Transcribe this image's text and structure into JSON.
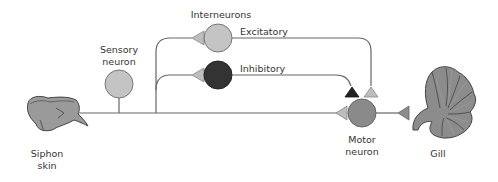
{
  "diagram": {
    "type": "neural circuit (gill-withdrawal reflex)",
    "labels": {
      "siphon_line1": "Siphon",
      "siphon_line2": "skin",
      "sensory_line1": "Sensory",
      "sensory_line2": "neuron",
      "interneurons": "Interneurons",
      "excitatory": "Excitatory",
      "inhibitory": "Inhibitory",
      "motor_line1": "Motor",
      "motor_line2": "neuron",
      "gill": "Gill"
    },
    "nodes": [
      {
        "id": "siphon-skin",
        "kind": "organ"
      },
      {
        "id": "sensory-neuron",
        "kind": "neuron",
        "fill": "#c4c4c4"
      },
      {
        "id": "excitatory-interneuron",
        "kind": "neuron",
        "fill": "#c4c4c4"
      },
      {
        "id": "inhibitory-interneuron",
        "kind": "neuron",
        "fill": "#333333"
      },
      {
        "id": "motor-neuron",
        "kind": "neuron",
        "fill": "#8a8a8a"
      },
      {
        "id": "gill",
        "kind": "organ"
      }
    ],
    "connections": [
      {
        "from": "siphon-skin",
        "to": "sensory-neuron"
      },
      {
        "from": "sensory-neuron",
        "to": "excitatory-interneuron",
        "synapse": "light"
      },
      {
        "from": "sensory-neuron",
        "to": "inhibitory-interneuron",
        "synapse": "light"
      },
      {
        "from": "sensory-neuron",
        "to": "motor-neuron",
        "synapse": "light"
      },
      {
        "from": "excitatory-interneuron",
        "to": "motor-neuron",
        "synapse": "light"
      },
      {
        "from": "inhibitory-interneuron",
        "to": "motor-neuron",
        "synapse": "dark"
      },
      {
        "from": "motor-neuron",
        "to": "gill",
        "synapse": "medium"
      }
    ],
    "colors": {
      "line": "#666666",
      "light_synapse": "#bdbdbd",
      "dark_synapse": "#222222",
      "medium_synapse": "#8c8c8c"
    }
  }
}
